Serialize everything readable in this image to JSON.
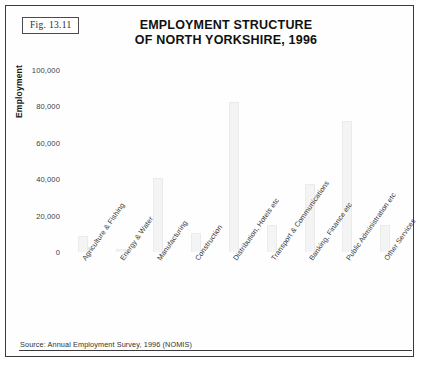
{
  "figure": {
    "label": "Fig. 13.11",
    "source_note": "Source: Annual Employment Survey, 1996 (NOMIS)"
  },
  "chart_data": {
    "type": "bar",
    "title": "EMPLOYMENT STRUCTURE OF NORTH YORKSHIRE, 1996",
    "title_lines": [
      "EMPLOYMENT STRUCTURE",
      "OF NORTH YORKSHIRE, 1996"
    ],
    "xlabel": "",
    "ylabel": "Employment",
    "ylim": [
      0,
      100000
    ],
    "grid": false,
    "legend": null,
    "ytick_labels": [
      "100,000",
      "80,000",
      "60,000",
      "40,000",
      "20,000",
      "0"
    ],
    "ytick_values": [
      100000,
      80000,
      60000,
      40000,
      20000,
      0
    ],
    "categories": [
      "Agriculture & Fishing",
      "Energy & Water",
      "Manufacturing",
      "Construction",
      "Distribution, Hotels etc",
      "Transport & Communications",
      "Banking, Finance etc",
      "Public Administration etc",
      "Other Services"
    ],
    "values": [
      8800,
      1600,
      40700,
      10400,
      82400,
      14800,
      37400,
      72000,
      14800
    ],
    "bar_color": "#f4f4f4"
  }
}
